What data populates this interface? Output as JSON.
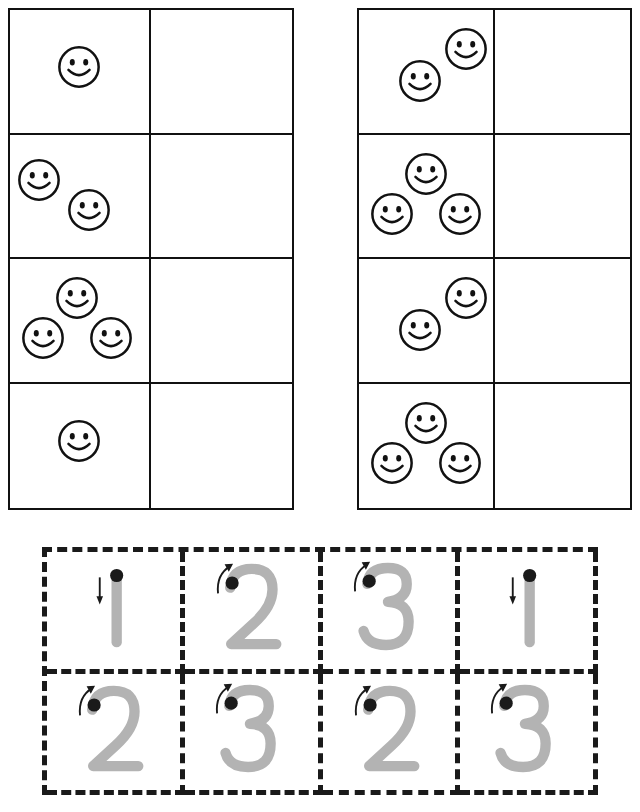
{
  "worksheet": {
    "title": "Count and write the number - tracing numbers 1 to 3",
    "ink_color": "#111111",
    "trace_color": "#b3b3b3",
    "dot_color": "#1a1a1a",
    "dash_color": "#1a1a1a"
  },
  "counting_tables": [
    {
      "name": "left",
      "columns": [
        "picture",
        "answer"
      ],
      "rows": [
        {
          "count": 1,
          "arrangement": "arr-1",
          "answer": ""
        },
        {
          "count": 2,
          "arrangement": "arr-2",
          "answer": ""
        },
        {
          "count": 3,
          "arrangement": "arr-3",
          "answer": ""
        },
        {
          "count": 1,
          "arrangement": "arr-1",
          "answer": ""
        }
      ]
    },
    {
      "name": "right",
      "columns": [
        "picture",
        "answer"
      ],
      "rows": [
        {
          "count": 2,
          "arrangement": "arr-2b",
          "answer": ""
        },
        {
          "count": 3,
          "arrangement": "arr-3",
          "answer": ""
        },
        {
          "count": 2,
          "arrangement": "arr-2b",
          "answer": ""
        },
        {
          "count": 3,
          "arrangement": "arr-3",
          "answer": ""
        }
      ]
    }
  ],
  "tracing_grid": {
    "rows": 2,
    "columns": 4,
    "cells": [
      {
        "digit": "1",
        "stroke_hint": "down-arrow"
      },
      {
        "digit": "2",
        "stroke_hint": "curve-up-arrow"
      },
      {
        "digit": "3",
        "stroke_hint": "curve-up-arrow"
      },
      {
        "digit": "1",
        "stroke_hint": "down-arrow"
      },
      {
        "digit": "2",
        "stroke_hint": "curve-up-arrow"
      },
      {
        "digit": "3",
        "stroke_hint": "curve-up-arrow"
      },
      {
        "digit": "2",
        "stroke_hint": "curve-up-arrow"
      },
      {
        "digit": "3",
        "stroke_hint": "curve-up-arrow"
      }
    ]
  },
  "footer": {
    "credit": ""
  }
}
